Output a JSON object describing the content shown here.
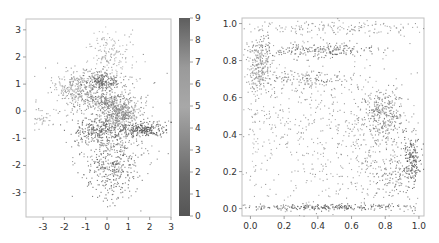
{
  "chart_data": [
    {
      "type": "scatter",
      "title": "",
      "xlabel": "",
      "ylabel": "",
      "xlim": [
        -3.8,
        3.0
      ],
      "ylim": [
        -3.9,
        3.4
      ],
      "xticks": [
        -3,
        -2,
        -1,
        0,
        1,
        2,
        3
      ],
      "yticks": [
        3,
        2,
        1,
        0,
        -1,
        -2,
        -3
      ],
      "grid": false,
      "color_by": "class label 0-9 (grayscale colormap)",
      "colorbar": {
        "min": 0,
        "max": 9,
        "ticks": [
          9,
          8,
          7,
          6,
          5,
          4,
          3,
          2,
          1,
          0
        ],
        "from_color": "#555555",
        "to_color": "#8c8c8c"
      },
      "clusters": [
        {
          "label": 6,
          "cx": -1.5,
          "cy": 0.9,
          "sx": 0.55,
          "sy": 0.35,
          "n": 260,
          "gray": 150
        },
        {
          "label": 7,
          "cx": -0.3,
          "cy": 1.1,
          "sx": 0.45,
          "sy": 0.18,
          "n": 220,
          "gray": 105
        },
        {
          "label": 8,
          "cx": 0.1,
          "cy": 2.0,
          "sx": 0.6,
          "sy": 0.55,
          "n": 170,
          "gray": 165
        },
        {
          "label": 5,
          "cx": 0.6,
          "cy": -0.1,
          "sx": 0.45,
          "sy": 0.25,
          "n": 320,
          "gray": 140
        },
        {
          "label": 4,
          "cx": -0.1,
          "cy": 0.4,
          "sx": 0.6,
          "sy": 0.15,
          "n": 200,
          "gray": 125
        },
        {
          "label": 1,
          "cx": 1.6,
          "cy": -0.65,
          "sx": 0.55,
          "sy": 0.13,
          "n": 230,
          "gray": 85
        },
        {
          "label": 0,
          "cx": -0.4,
          "cy": -0.7,
          "sx": 0.6,
          "sy": 0.25,
          "n": 240,
          "gray": 95
        },
        {
          "label": 2,
          "cx": 0.2,
          "cy": -2.0,
          "sx": 0.6,
          "sy": 0.65,
          "n": 380,
          "gray": 110
        },
        {
          "label": 3,
          "cx": -3.0,
          "cy": -0.2,
          "sx": 0.35,
          "sy": 0.2,
          "n": 40,
          "gray": 160
        },
        {
          "label": 9,
          "cx": 0.3,
          "cy": -0.3,
          "sx": 1.1,
          "sy": 0.9,
          "n": 300,
          "gray": 130
        }
      ]
    },
    {
      "type": "scatter",
      "title": "",
      "xlabel": "",
      "ylabel": "",
      "xlim": [
        -0.05,
        1.03
      ],
      "ylim": [
        -0.04,
        1.03
      ],
      "xticks": [
        0.0,
        0.2,
        0.4,
        0.6,
        0.8,
        1.0
      ],
      "yticks": [
        1.0,
        0.8,
        0.6,
        0.4,
        0.2,
        0.0
      ],
      "xtick_labels": [
        "0.0",
        "0.2",
        "0.4",
        "0.6",
        "0.8",
        "1.0"
      ],
      "ytick_labels": [
        "1.0",
        "0.8",
        "0.6",
        "0.4",
        "0.2",
        "0.0"
      ],
      "grid": false,
      "clusters": [
        {
          "cx": 0.05,
          "cy": 0.78,
          "sx": 0.04,
          "sy": 0.09,
          "n": 300,
          "gray": 140
        },
        {
          "cx": 0.4,
          "cy": 0.86,
          "sx": 0.16,
          "sy": 0.02,
          "n": 220,
          "gray": 110
        },
        {
          "cx": 0.55,
          "cy": 0.98,
          "sx": 0.3,
          "sy": 0.02,
          "n": 160,
          "gray": 150
        },
        {
          "cx": 0.35,
          "cy": 0.7,
          "sx": 0.12,
          "sy": 0.025,
          "n": 110,
          "gray": 120
        },
        {
          "cx": 0.78,
          "cy": 0.5,
          "sx": 0.06,
          "sy": 0.07,
          "n": 300,
          "gray": 125
        },
        {
          "cx": 0.96,
          "cy": 0.27,
          "sx": 0.025,
          "sy": 0.06,
          "n": 140,
          "gray": 80
        },
        {
          "cx": 0.45,
          "cy": 0.01,
          "sx": 0.28,
          "sy": 0.008,
          "n": 260,
          "gray": 100
        },
        {
          "cx": 0.5,
          "cy": 0.4,
          "sx": 0.28,
          "sy": 0.22,
          "n": 650,
          "gray": 150
        },
        {
          "cx": 0.85,
          "cy": 0.2,
          "sx": 0.08,
          "sy": 0.08,
          "n": 160,
          "gray": 115
        },
        {
          "cx": 0.02,
          "cy": 0.45,
          "sx": 0.012,
          "sy": 0.2,
          "n": 40,
          "gray": 170
        }
      ]
    }
  ],
  "left_panel": {
    "xtick_labels": [
      "-3",
      "-2",
      "-1",
      "0",
      "1",
      "2",
      "3"
    ],
    "ytick_labels": [
      "3",
      "2",
      "1",
      "0",
      "-1",
      "-2",
      "-3"
    ],
    "colorbar_labels": [
      "9",
      "8",
      "7",
      "6",
      "5",
      "4",
      "3",
      "2",
      "1",
      "0"
    ]
  },
  "right_panel": {
    "xtick_labels": [
      "0.0",
      "0.2",
      "0.4",
      "0.6",
      "0.8",
      "1.0"
    ],
    "ytick_labels": [
      "1.0",
      "0.8",
      "0.6",
      "0.4",
      "0.2",
      "0.0"
    ]
  }
}
